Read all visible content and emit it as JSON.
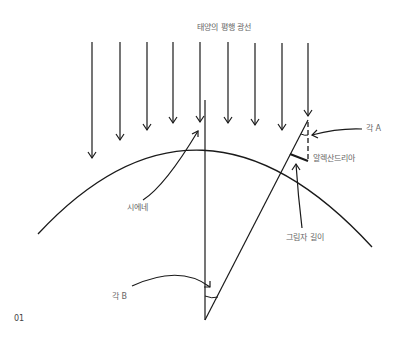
{
  "diagram": {
    "title": "태양의 평행 광선",
    "labels": {
      "angle_a": "각 A",
      "alexandria": "알렉산드리아",
      "syene": "시에네",
      "shadow_length": "그림자 길이",
      "angle_b": "각 B"
    },
    "figure_number": "01",
    "stroke_color": "#1a1a1a",
    "text_color": "#666666"
  }
}
